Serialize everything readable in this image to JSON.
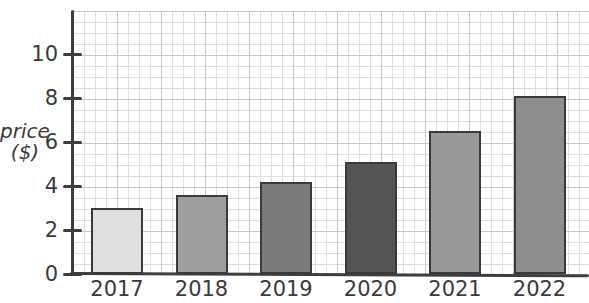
{
  "chart_data": {
    "type": "bar",
    "categories": [
      "2017",
      "2018",
      "2019",
      "2020",
      "2021",
      "2022"
    ],
    "values": [
      3.0,
      3.6,
      4.2,
      5.1,
      6.5,
      8.1
    ],
    "bar_colors": [
      "#dfdfdf",
      "#9e9e9e",
      "#7b7b7b",
      "#545454",
      "#989898",
      "#8d8d8d"
    ],
    "title": "",
    "xlabel": "",
    "ylabel": "price ($)",
    "ylim": [
      0,
      11.9
    ],
    "yticks": [
      0,
      2,
      4,
      6,
      8,
      10
    ],
    "grid": true,
    "legend_position": "none"
  },
  "axis_label": {
    "line1": "price",
    "line2": "($)"
  },
  "colors": {
    "axis": "#3d3d3d",
    "bar_border": "#3a3a3a",
    "grid_minor": "#dedede",
    "grid_major": "#c9c9c9",
    "text": "#3a3a3a",
    "background": "#ffffff"
  }
}
